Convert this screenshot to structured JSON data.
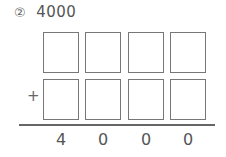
{
  "problem": {
    "number": "②",
    "value": "4000"
  },
  "grid": {
    "rows": 2,
    "columns": 4,
    "operator": "+"
  },
  "result": {
    "digits": [
      "4",
      "0",
      "0",
      "0"
    ]
  }
}
